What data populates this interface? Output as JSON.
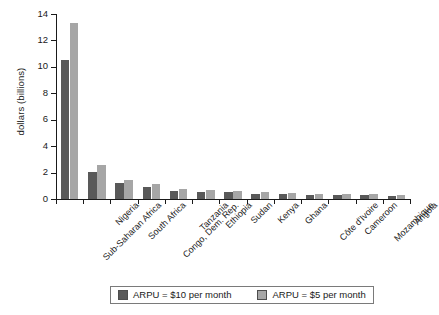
{
  "chart_data": {
    "type": "bar",
    "title": "",
    "xlabel": "",
    "ylabel": "dollars (billions)",
    "ylim": [
      0,
      14
    ],
    "yticks": [
      0,
      2,
      4,
      6,
      8,
      10,
      12,
      14
    ],
    "ytick_labels": [
      "0",
      "2",
      "4",
      "6",
      "8",
      "10",
      "12",
      "14"
    ],
    "grid": false,
    "legend_position": "bottom",
    "categories": [
      "Sub-Saharan Africa",
      "Nigeria",
      "South Africa",
      "Congo, Dem. Rep.",
      "Tanzania",
      "Ethiopia",
      "Sudan",
      "Kenya",
      "Ghana",
      "Côte d'Ivoire",
      "Cameroon",
      "Mozambique",
      "Angola"
    ],
    "series": [
      {
        "name": "ARPU = $10 per month",
        "color": "#595959",
        "values": [
          10.5,
          2.05,
          1.2,
          0.9,
          0.62,
          0.55,
          0.5,
          0.4,
          0.35,
          0.32,
          0.3,
          0.28,
          0.22
        ]
      },
      {
        "name": "ARPU = $5 per month",
        "color": "#a6a6a6",
        "values": [
          13.3,
          2.6,
          1.45,
          1.1,
          0.75,
          0.67,
          0.62,
          0.5,
          0.45,
          0.4,
          0.38,
          0.35,
          0.3
        ]
      }
    ]
  },
  "legend": {
    "items": [
      {
        "label": "ARPU = $10 per month",
        "swatch": "dark"
      },
      {
        "label": "ARPU = $5 per month",
        "swatch": "light"
      }
    ]
  }
}
